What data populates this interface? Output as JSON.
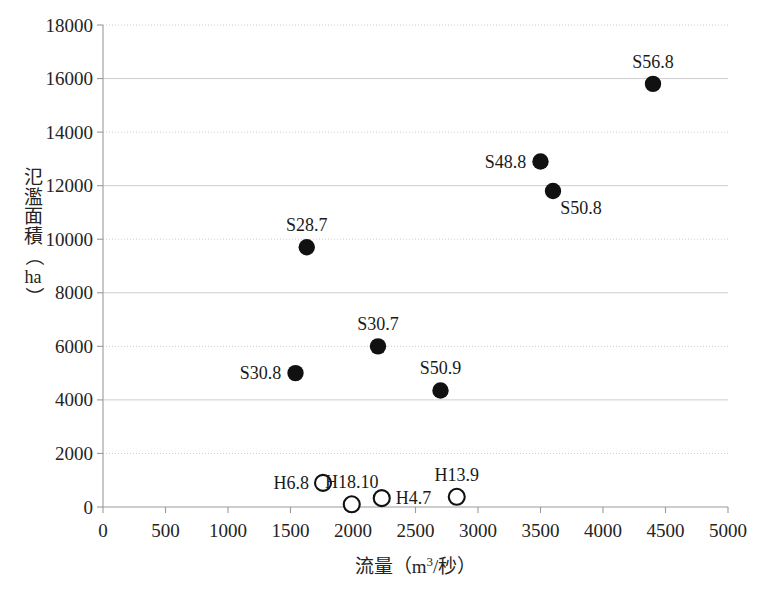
{
  "chart_data": {
    "type": "scatter",
    "title": "",
    "xlabel": "流量（m3/秒）",
    "ylabel": "氾濫面積（ha）",
    "xlim": [
      0,
      5000
    ],
    "ylim": [
      0,
      18000
    ],
    "xticks": [
      0,
      500,
      1000,
      1500,
      2000,
      2500,
      3000,
      3500,
      4000,
      4500,
      5000
    ],
    "yticks": [
      0,
      2000,
      4000,
      6000,
      8000,
      10000,
      12000,
      14000,
      16000,
      18000
    ],
    "grid": "horizontal",
    "legend": "none",
    "series": [
      {
        "name": "S-series (filled)",
        "marker": "filled-circle",
        "color": "#111111",
        "points": [
          {
            "label": "S30.8",
            "x": 1540,
            "y": 5000,
            "label_pos": "left"
          },
          {
            "label": "S28.7",
            "x": 1630,
            "y": 9700,
            "label_pos": "top"
          },
          {
            "label": "S30.7",
            "x": 2200,
            "y": 6000,
            "label_pos": "top"
          },
          {
            "label": "S50.9",
            "x": 2700,
            "y": 4350,
            "label_pos": "top"
          },
          {
            "label": "S48.8",
            "x": 3500,
            "y": 12900,
            "label_pos": "left"
          },
          {
            "label": "S50.8",
            "x": 3600,
            "y": 11800,
            "label_pos": "right-below"
          },
          {
            "label": "S56.8",
            "x": 4400,
            "y": 15800,
            "label_pos": "top"
          }
        ]
      },
      {
        "name": "H-series (open)",
        "marker": "open-circle",
        "color": "#111111",
        "points": [
          {
            "label": "H6.8",
            "x": 1760,
            "y": 900,
            "label_pos": "left"
          },
          {
            "label": "H18.10",
            "x": 1990,
            "y": 100,
            "label_pos": "top"
          },
          {
            "label": "H4.7",
            "x": 2230,
            "y": 330,
            "label_pos": "right"
          },
          {
            "label": "H13.9",
            "x": 2830,
            "y": 380,
            "label_pos": "top"
          }
        ]
      }
    ]
  },
  "axes": {
    "y_label_chars": [
      "氾",
      "濫",
      "面",
      "積"
    ],
    "y_label_open_paren": "（",
    "y_label_unit": "ha",
    "y_label_close_paren": "）",
    "x_axis_title_prefix": "流量（m",
    "x_axis_title_sup": "3",
    "x_axis_title_suffix": "/秒）"
  },
  "colors": {
    "marker": "#111111",
    "axis": "#9a9a9a",
    "grid": "#c8c8c8",
    "text": "#242424",
    "background": "#ffffff"
  }
}
